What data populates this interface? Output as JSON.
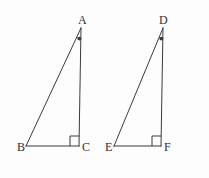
{
  "figure": {
    "background_color": "#fdfdfd",
    "stroke_color": "#3a3a42",
    "label_color": "#2f2f36",
    "width": 209,
    "height": 178
  },
  "triangles": [
    {
      "id": "triangle-abc",
      "vertices": [
        {
          "label": "A",
          "x": 81,
          "y": 28,
          "label_x": 78,
          "label_y": 24
        },
        {
          "label": "B",
          "x": 26,
          "y": 146,
          "label_x": 18,
          "label_y": 151
        },
        {
          "label": "C",
          "x": 79,
          "y": 146,
          "label_x": 82,
          "label_y": 151
        }
      ],
      "right_angle_at": "C",
      "marked_angle_at": "A"
    },
    {
      "id": "triangle-def",
      "vertices": [
        {
          "label": "D",
          "x": 163,
          "y": 28,
          "label_x": 160,
          "label_y": 24
        },
        {
          "label": "E",
          "x": 114,
          "y": 146,
          "label_x": 106,
          "label_y": 151
        },
        {
          "label": "F",
          "x": 161,
          "y": 146,
          "label_x": 164,
          "label_y": 151
        }
      ],
      "right_angle_at": "F",
      "marked_angle_at": "D"
    }
  ]
}
